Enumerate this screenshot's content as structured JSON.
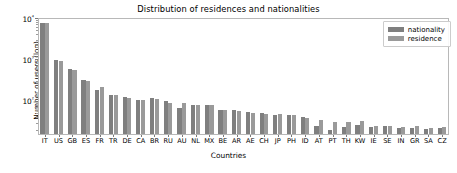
{
  "chart_data": {
    "type": "bar",
    "title": "Distribution of residences and nationalities",
    "xlabel": "Countries",
    "ylabel": "Number of users (log)",
    "yscale": "log",
    "ylim": [
      15,
      10000
    ],
    "grid": false,
    "legend_position": "upper right",
    "ytick_labels": [
      "10²",
      "10³",
      "10⁴"
    ],
    "ytick_values": [
      100,
      1000,
      10000
    ],
    "categories": [
      "IT",
      "US",
      "GB",
      "ES",
      "FR",
      "TR",
      "DE",
      "CA",
      "BR",
      "RU",
      "AU",
      "NL",
      "MX",
      "BE",
      "AR",
      "AE",
      "CH",
      "JP",
      "PH",
      "ID",
      "AT",
      "PT",
      "TH",
      "KW",
      "IE",
      "SE",
      "IN",
      "GR",
      "SA",
      "CZ"
    ],
    "series": [
      {
        "name": "nationality",
        "color": "#7f7f7f",
        "values": [
          7300,
          930,
          555,
          300,
          172,
          130,
          118,
          98,
          113,
          96,
          65,
          74,
          76,
          57,
          56,
          50,
          47,
          44,
          43,
          38,
          23,
          19,
          22,
          25,
          22,
          24,
          21,
          21,
          20,
          21
        ]
      },
      {
        "name": "residence",
        "color": "#9a9a9a",
        "values": [
          7250,
          880,
          540,
          292,
          205,
          129,
          112,
          102,
          106,
          86,
          83,
          75,
          76,
          56,
          55,
          49,
          45,
          45,
          43,
          37,
          32,
          30,
          30,
          31,
          23,
          24,
          22,
          23,
          21,
          22
        ]
      }
    ]
  },
  "legend": {
    "items": [
      {
        "label": "nationality"
      },
      {
        "label": "residence"
      }
    ]
  }
}
